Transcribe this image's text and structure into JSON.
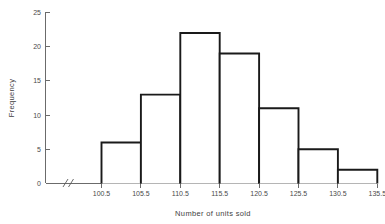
{
  "chart_data": {
    "type": "bar",
    "title": "",
    "subtitle": "",
    "xlabel": "Number of units sold",
    "ylabel": "Frequency",
    "bin_edges": [
      100.5,
      105.5,
      110.5,
      115.5,
      120.5,
      125.5,
      130.5,
      135.5
    ],
    "categories": [
      "100.5-105.5",
      "105.5-110.5",
      "110.5-115.5",
      "115.5-120.5",
      "120.5-125.5",
      "125.5-130.5",
      "130.5-135.5"
    ],
    "values": [
      6,
      13,
      22,
      19,
      11,
      5,
      2
    ],
    "xtick_labels": [
      "100.5",
      "105.5",
      "110.5",
      "115.5",
      "120.5",
      "125.5",
      "130.5",
      "135.5"
    ],
    "ytick_labels": [
      "0",
      "5",
      "10",
      "15",
      "20",
      "25"
    ],
    "ytick_values": [
      0,
      5,
      10,
      15,
      20,
      25
    ],
    "ylim": [
      0,
      25
    ],
    "grid": false,
    "legend": false,
    "axis_break": true,
    "axis_break_symbol": "//",
    "colors": {
      "bar_outline": "#1a1a1a",
      "bar_fill": "#ffffff",
      "axis": "#6b6b6b",
      "text": "#3f3f3f",
      "background": "#ffffff"
    }
  }
}
